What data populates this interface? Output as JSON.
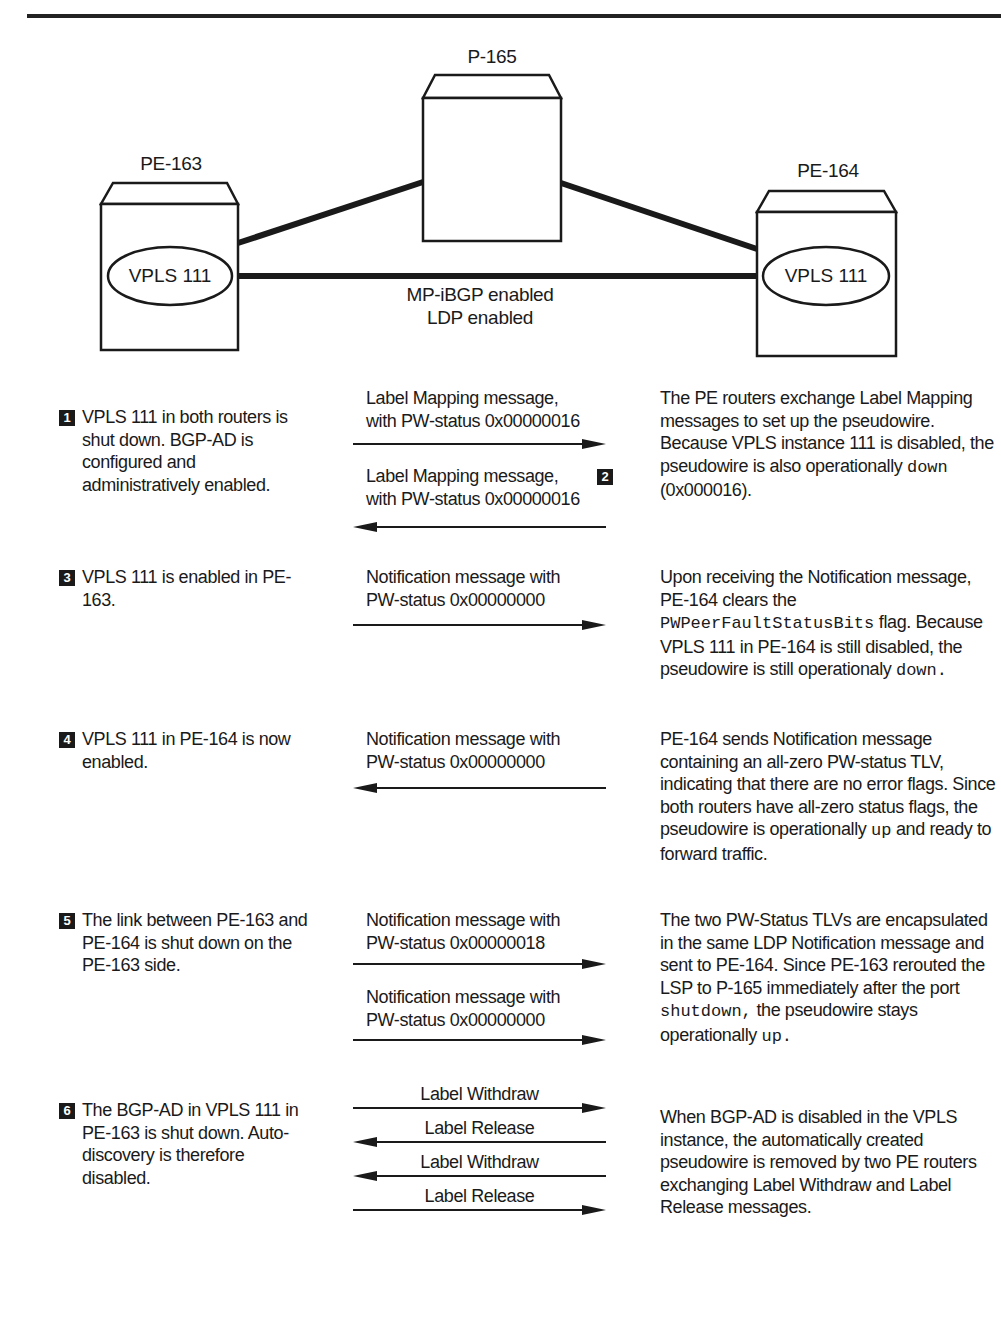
{
  "figure": {
    "caption_partial": "Figure ... VPLS 111 ... BGP-AD ... pseudowire setup, teardown, and signaling ..."
  },
  "topology": {
    "nodes": [
      {
        "id": "P-165",
        "label": "P-165"
      },
      {
        "id": "PE-163",
        "label": "PE-163",
        "service": "VPLS 111"
      },
      {
        "id": "PE-164",
        "label": "PE-164",
        "service": "VPLS 111"
      }
    ],
    "links": [
      {
        "from": "PE-163",
        "to": "P-165"
      },
      {
        "from": "P-165",
        "to": "PE-164"
      },
      {
        "from": "PE-163",
        "to": "PE-164",
        "labels": [
          "MP-iBGP enabled",
          "LDP enabled"
        ]
      }
    ]
  },
  "steps": [
    {
      "number": "1",
      "text": "VPLS 111 in both routers is shut down. BGP-AD is configured and administratively enabled.",
      "messages": [
        {
          "line1": "Label Mapping message,",
          "line2": "with PW-status 0x00000016",
          "direction": "right"
        },
        {
          "line1": "Label Mapping message,",
          "line2": "with PW-status 0x00000016",
          "direction": "left",
          "badge": "2"
        }
      ],
      "description": {
        "pre": "The PE routers exchange Label Mapping messages to set up the pseudowire. Because VPLS instance 111 is disabled, the pseudowire is also operationally ",
        "code": "down",
        "post": " (0x000016)."
      }
    },
    {
      "number": "3",
      "text": "VPLS 111 is enabled in PE-163.",
      "messages": [
        {
          "line1": "Notification message with",
          "line2": "PW-status 0x00000000",
          "direction": "right"
        }
      ],
      "description": {
        "pre": "Upon receiving the Notification message, PE-164 clears the ",
        "code": "PWPeerFaultStatusBits",
        "mid": " flag. Because VPLS 111 in PE-164 is still disabled, the pseudowire is still operationaly ",
        "code2": "down."
      }
    },
    {
      "number": "4",
      "text": "VPLS 111 in PE-164 is now enabled.",
      "messages": [
        {
          "line1": "Notification message with",
          "line2": "PW-status 0x00000000",
          "direction": "left"
        }
      ],
      "description": {
        "pre": "PE-164 sends Notification message containing an all-zero PW-status TLV, indicating that there are no error flags. Since both routers have all-zero status flags, the pseudowire is operationally ",
        "code": "up",
        "post": " and ready to forward traffic."
      }
    },
    {
      "number": "5",
      "text": "The link between PE-163 and PE-164 is shut down on the PE-163 side.",
      "messages": [
        {
          "line1": "Notification message with",
          "line2": "PW-status 0x00000018",
          "direction": "right"
        },
        {
          "line1": "Notification message with",
          "line2": "PW-status 0x00000000",
          "direction": "right"
        }
      ],
      "description": {
        "pre": "The two PW-Status TLVs are encapsulated in the same LDP Notification message and sent to PE-164. Since PE-163 rerouted the LSP to P-165 immediately after the port ",
        "code": "shutdown,",
        "mid": " the pseudowire stays operationally ",
        "code2": "up."
      }
    },
    {
      "number": "6",
      "text": "The BGP-AD in VPLS 111 in PE-163 is shut down. Auto-discovery is therefore disabled.",
      "messages": [
        {
          "line1": "Label Withdraw",
          "direction": "right"
        },
        {
          "line1": "Label Release",
          "direction": "left"
        },
        {
          "line1": "Label Withdraw",
          "direction": "left"
        },
        {
          "line1": "Label Release",
          "direction": "right"
        }
      ],
      "description": {
        "pre": "When BGP-AD is disabled in the VPLS instance, the automatically created pseudowire is removed by two PE routers exchanging Label Withdraw and Label Release messages."
      }
    }
  ]
}
